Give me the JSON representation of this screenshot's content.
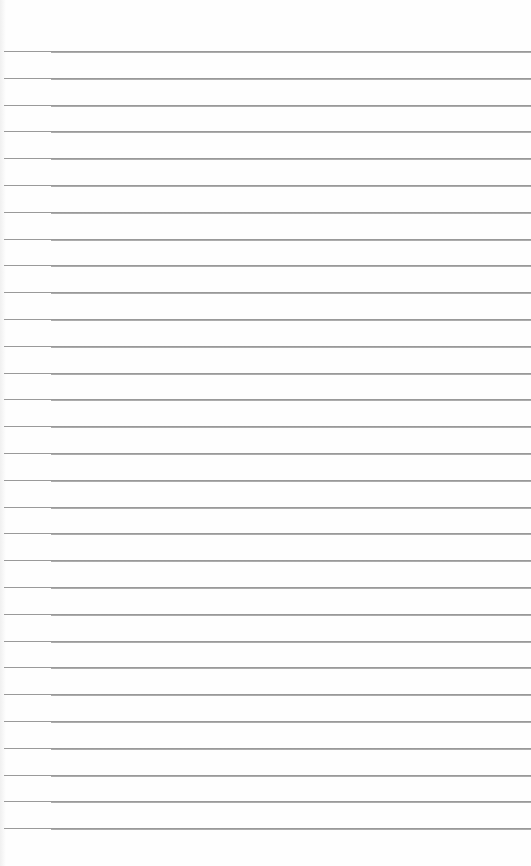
{
  "sheet": {
    "type": "lined-paper",
    "background_color": "#fefefe",
    "line_color": "#8c8c8c",
    "line_count": 30,
    "first_line_y": 51,
    "line_spacing": 26.8,
    "margin_x": 51
  }
}
